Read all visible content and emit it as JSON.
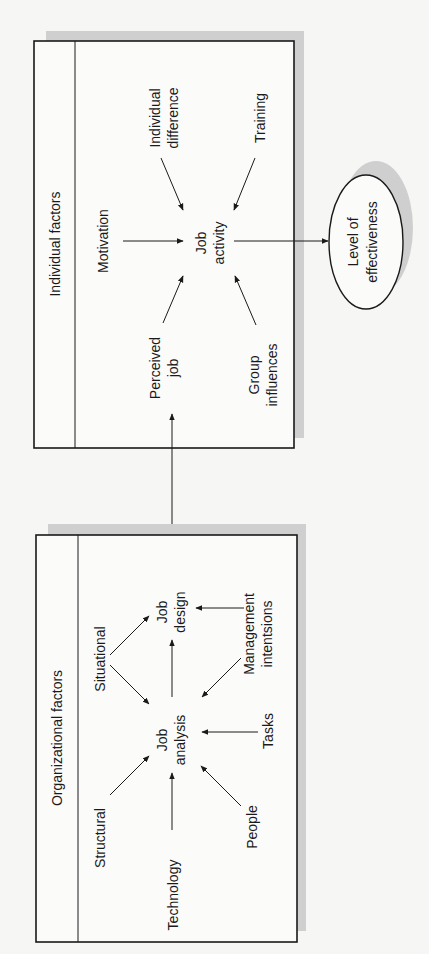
{
  "diagram": {
    "orientation": "rotated-90-ccw",
    "colors": {
      "background": "#f6f6f5",
      "line": "#1a1a1a",
      "shadow": "#cfcfcf"
    },
    "individual_panel": {
      "header": "Individual factors",
      "center_node": {
        "line1": "Job",
        "line2": "activity"
      },
      "inputs": [
        {
          "id": "motivation",
          "line1": "Motivation",
          "line2": ""
        },
        {
          "id": "individual_difference",
          "line1": "Individual",
          "line2": "difference"
        },
        {
          "id": "training",
          "line1": "Training",
          "line2": ""
        },
        {
          "id": "perceived_job",
          "line1": "Perceived",
          "line2": "job"
        },
        {
          "id": "group_influences",
          "line1": "Group",
          "line2": "influences"
        }
      ]
    },
    "organizational_panel": {
      "header": "Organizational factors",
      "job_analysis": {
        "line1": "Job",
        "line2": "analysis"
      },
      "job_design": {
        "line1": "Job",
        "line2": "design"
      },
      "inputs": [
        {
          "id": "situational",
          "line1": "Situational",
          "line2": ""
        },
        {
          "id": "structural",
          "line1": "Structural",
          "line2": ""
        },
        {
          "id": "technology",
          "line1": "Technology",
          "line2": ""
        },
        {
          "id": "people",
          "line1": "People",
          "line2": ""
        },
        {
          "id": "tasks",
          "line1": "Tasks",
          "line2": ""
        },
        {
          "id": "management_intentions",
          "line1": "Management",
          "line2": "intentsions"
        }
      ]
    },
    "outcome": {
      "line1": "Level of",
      "line2": "effectiveness"
    },
    "edges": [
      [
        "Motivation",
        "Job activity"
      ],
      [
        "Individual difference",
        "Job activity"
      ],
      [
        "Training",
        "Job activity"
      ],
      [
        "Perceived job",
        "Job activity"
      ],
      [
        "Group influences",
        "Job activity"
      ],
      [
        "Job activity",
        "Level of effectiveness"
      ],
      [
        "Job design",
        "Perceived job"
      ],
      [
        "Situational",
        "Job analysis"
      ],
      [
        "Situational",
        "Job design"
      ],
      [
        "Structural",
        "Job analysis"
      ],
      [
        "Technology",
        "Job analysis"
      ],
      [
        "People",
        "Job analysis"
      ],
      [
        "Tasks",
        "Job analysis"
      ],
      [
        "Management intentsions",
        "Job analysis"
      ],
      [
        "Management intentsions",
        "Job design"
      ],
      [
        "Job analysis",
        "Job design"
      ]
    ]
  }
}
